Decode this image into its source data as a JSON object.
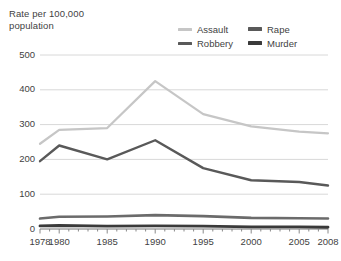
{
  "axis_title": "Rate per 100,000\npopulation",
  "legend": [
    {
      "name": "assault",
      "label": "Assault",
      "color": "#c6c6c6",
      "weight": "thin"
    },
    {
      "name": "rape",
      "label": "Rape",
      "color": "#595959",
      "weight": "thick"
    },
    {
      "name": "robbery",
      "label": "Robbery",
      "color": "#595959",
      "weight": "thin"
    },
    {
      "name": "murder",
      "label": "Murder",
      "color": "#3a3a3a",
      "weight": "thick"
    }
  ],
  "colors": {
    "assault": "#c6c6c6",
    "robbery": "#595959",
    "rape": "#6b6b6b",
    "murder": "#3a3a3a",
    "gridline": "#d8d8d8",
    "axis": "#8a8a8a",
    "text": "#3f3f3f",
    "background": "#ffffff"
  },
  "chart_data": {
    "type": "line",
    "title": "",
    "xlabel": "",
    "ylabel": "Rate per 100,000 population",
    "ylim": [
      0,
      500
    ],
    "yticks": [
      0,
      100,
      200,
      300,
      400,
      500
    ],
    "ytick_labels": [
      "0",
      "100",
      "200",
      "300",
      "400",
      "500"
    ],
    "xlim": [
      1978,
      2008
    ],
    "xticks": [
      1978,
      1980,
      1985,
      1990,
      1995,
      2000,
      2005,
      2008
    ],
    "xtick_labels": [
      "1978",
      "1980",
      "1985",
      "1990",
      "1995",
      "2000",
      "2005",
      "2008"
    ],
    "grid": true,
    "legend_position": "top-right",
    "x": [
      1978,
      1980,
      1985,
      1990,
      1995,
      2000,
      2005,
      2008
    ],
    "series": [
      {
        "name": "Assault",
        "color": "#c6c6c6",
        "width": 2.2,
        "values": [
          245,
          285,
          290,
          425,
          330,
          295,
          280,
          275
        ]
      },
      {
        "name": "Robbery",
        "color": "#595959",
        "width": 2.4,
        "values": [
          195,
          240,
          200,
          255,
          175,
          140,
          135,
          125
        ]
      },
      {
        "name": "Rape",
        "color": "#6b6b6b",
        "width": 2.6,
        "values": [
          30,
          35,
          36,
          40,
          37,
          32,
          31,
          30
        ]
      },
      {
        "name": "Murder",
        "color": "#3a3a3a",
        "width": 2.8,
        "values": [
          9,
          10,
          8,
          9,
          8,
          6,
          6,
          5
        ]
      }
    ]
  }
}
